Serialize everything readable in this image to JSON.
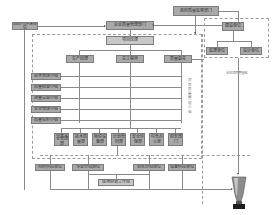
{
  "diagram": {
    "type": "organization-flowchart",
    "top": {
      "authority": "政府质量监督部门",
      "owner": "建设单位",
      "left_unit": "消防与环保单位",
      "company_hq": "企业质量管理部门",
      "project_manager": "项目经理"
    },
    "owner_group": {
      "supervision": "监理单位",
      "design": "设计单位",
      "group_label": "业主项目管理组"
    },
    "managers": {
      "production": "生产经理",
      "technical": "总工程师",
      "quality": "质量副总"
    },
    "left_groups": [
      "技术管理小组",
      "质量检查小组",
      "测量试验小组",
      "安全管理小组",
      "质量资料小组"
    ],
    "side_label": "项目质量管理小组",
    "departments": [
      "质量安全管理部",
      "技术质量部",
      "物资设备部",
      "计划合同部",
      "安全环保部",
      "综合办公室",
      "财务部门"
    ],
    "teams": {
      "materials": "材料供应单位",
      "team_a": "专业分包单位",
      "team_b": "劳务分包单位",
      "equipment": "设备供应单位",
      "coordination": "现场协调工作组"
    },
    "result_icon": "trophy-icon"
  }
}
